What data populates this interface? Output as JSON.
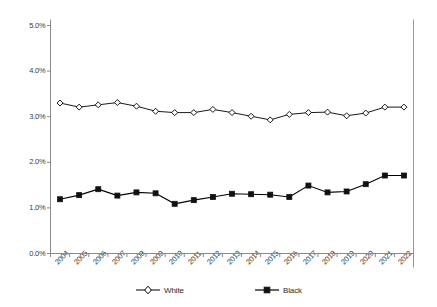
{
  "chart_data": {
    "type": "line",
    "title": "",
    "subtitle": "",
    "xlabel": "",
    "ylabel": "",
    "categories": [
      "2004",
      "2005",
      "2006",
      "2007",
      "2008",
      "2009",
      "2010",
      "2011",
      "2012",
      "2013",
      "2014",
      "2015",
      "2016",
      "2017",
      "2018",
      "2019",
      "2020",
      "2021",
      "2022"
    ],
    "ylim": [
      0.0,
      5.0
    ],
    "ytick_labels": [
      "0.0%",
      "1.0%",
      "2.0%",
      "3.0%",
      "4.0%",
      "5.0%"
    ],
    "ytick_values": [
      0.0,
      1.0,
      2.0,
      3.0,
      4.0,
      5.0
    ],
    "grid": false,
    "legend_position": "bottom",
    "series": [
      {
        "name": "White",
        "marker": "open-diamond",
        "color": "#000000",
        "values": [
          3.3,
          3.21,
          3.26,
          3.31,
          3.23,
          3.12,
          3.09,
          3.09,
          3.16,
          3.09,
          3.01,
          2.93,
          3.05,
          3.09,
          3.1,
          3.02,
          3.08,
          3.21,
          3.21
        ]
      },
      {
        "name": "Black",
        "marker": "filled-square",
        "color": "#000000",
        "values": [
          1.19,
          1.28,
          1.41,
          1.27,
          1.34,
          1.32,
          1.09,
          1.17,
          1.24,
          1.31,
          1.3,
          1.29,
          1.24,
          1.49,
          1.34,
          1.36,
          1.52,
          1.71,
          1.71
        ]
      }
    ]
  },
  "legend": {
    "entries": [
      {
        "label": "White",
        "marker": "open-diamond"
      },
      {
        "label": "Black",
        "marker": "filled-square"
      }
    ]
  },
  "axes": {
    "y_axis_name": "percent-axis",
    "x_axis_name": "year-axis"
  }
}
